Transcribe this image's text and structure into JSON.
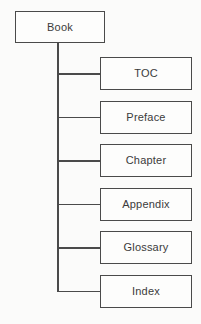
{
  "diagram": {
    "type": "tree",
    "root": {
      "label": "Book"
    },
    "children": [
      {
        "label": "TOC"
      },
      {
        "label": "Preface"
      },
      {
        "label": "Chapter"
      },
      {
        "label": "Appendix"
      },
      {
        "label": "Glossary"
      },
      {
        "label": "Index"
      }
    ],
    "colors": {
      "line": "#4a4a4a",
      "box_border": "#4a4a4a",
      "box_background": "#fdfdfc",
      "text": "#3b3b3b",
      "page_background": "#fbfbfa"
    }
  }
}
